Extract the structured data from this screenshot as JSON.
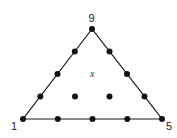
{
  "diagram": {
    "type": "triangular-lattice",
    "vertices": [
      {
        "label": "9",
        "x": 92,
        "y": 29
      },
      {
        "label": "1",
        "x": 23,
        "y": 119
      },
      {
        "label": "5",
        "x": 162,
        "y": 119
      }
    ],
    "edge_points": [
      {
        "x": 40.3,
        "y": 96.5
      },
      {
        "x": 57.5,
        "y": 74
      },
      {
        "x": 74.8,
        "y": 51.5
      },
      {
        "x": 144.5,
        "y": 96.5
      },
      {
        "x": 127,
        "y": 74
      },
      {
        "x": 109.5,
        "y": 51.5
      },
      {
        "x": 57.8,
        "y": 119
      },
      {
        "x": 92.5,
        "y": 119
      },
      {
        "x": 127.3,
        "y": 119
      }
    ],
    "interior_points": [
      {
        "x": 75,
        "y": 96.5
      },
      {
        "x": 109.5,
        "y": 96.5
      }
    ],
    "center_mark": {
      "label": "x",
      "x": 92.5,
      "y": 74
    },
    "colors": {
      "line": "#1a1a1a",
      "dot": "#111111"
    }
  }
}
